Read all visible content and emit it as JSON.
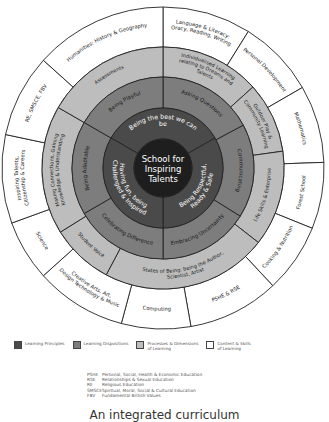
{
  "center": {
    "line1": "School for",
    "line2": "Inspiring",
    "line3": "Talents"
  },
  "colors": {
    "center": "#1e1e1e",
    "principles": "#4a4a4a",
    "dispositions": "#7d7d7d",
    "processes": "#bdbdbd",
    "content": "#ffffff",
    "line": "#222222"
  },
  "rings": {
    "principles": [
      "Being the best we can be",
      "Being Respectful, Ready & Safe",
      "Having fun, being Challenged & Inspired"
    ],
    "dispositions": [
      "Asking Questions",
      "Communicating",
      "Embracing Uncertainty",
      "Celebrating Difference",
      "Being Adaptable",
      "Being Playful"
    ],
    "processes": [
      "Individualised Learning relating to Dreams and Talents",
      "Outdoor Play & Community Learning",
      "Life Skills & Enterprise",
      "States of Being: being the Author, Scientist, Artist",
      "Student Voice",
      "Making Connections, Gaining Knowledge & Understanding",
      "Assessments"
    ],
    "content": [
      "Language & Literacy: Oracy, Reading, Writing",
      "Personal Development",
      "Mathematics",
      "Forest School",
      "Cooking & Nutrition",
      "PSHE & RSE",
      "Computing",
      "Creative Arts, Art, Design Technology & Music",
      "Science",
      "Inspiring Talents, Citizenship & Careers",
      "RE, SMSCE, FBV",
      "Humanities: History & Geography"
    ]
  },
  "legend": [
    {
      "label": "Learning Principles",
      "color": "#4a4a4a"
    },
    {
      "label": "Learning Dispositions",
      "color": "#7d7d7d"
    },
    {
      "label": "Processes & Dimensions\nof Learning",
      "color": "#bdbdbd"
    },
    {
      "label": "Content & Skills\nof Learning",
      "color": "#ffffff"
    }
  ],
  "abbreviations": [
    {
      "key": "PSHE",
      "value": "Personal, Social, Health & Economic Education"
    },
    {
      "key": "RSE",
      "value": "Relationships & Sexual Education"
    },
    {
      "key": "RE",
      "value": "Religious Education"
    },
    {
      "key": "SMSCE",
      "value": "Spiritual, Moral, Social & Cultural Education"
    },
    {
      "key": "FBV",
      "value": "Fundamental British Values"
    }
  ],
  "caption": "An integrated curriculum"
}
